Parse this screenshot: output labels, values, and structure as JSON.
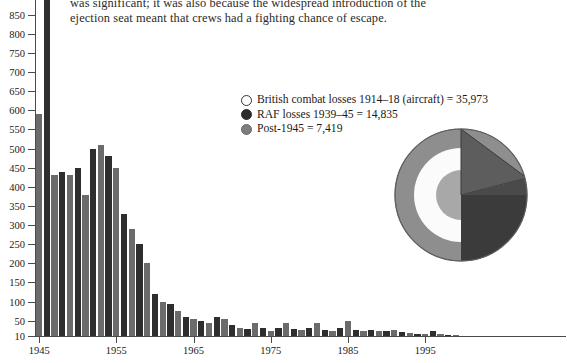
{
  "body_text": {
    "lines": [
      "was significant; it was also because the widespread introduction of the",
      "ejection seat meant that crews had a fighting chance of escape."
    ]
  },
  "legend": {
    "items": [
      {
        "marker": "open-circle",
        "label": "British combat losses 1914–18 (aircraft) = 35,973",
        "value": 35973,
        "color": "#ffffff"
      },
      {
        "marker": "filled-circle",
        "label": "RAF losses 1939–45 = 14,835",
        "value": 14835,
        "color": "#2d2d2d"
      },
      {
        "marker": "gray-circle",
        "label": "Post-1945 = 7,419",
        "value": 7419,
        "color": "#7d7d7d"
      }
    ]
  },
  "chart_data": {
    "type": "bar",
    "title": "",
    "xlabel": "",
    "ylabel": "",
    "ylim": [
      10,
      920
    ],
    "xlim": [
      1945,
      2000
    ],
    "grid": false,
    "legend_position": "upper-right",
    "ytick_labels": [
      "10",
      "50",
      "100",
      "150",
      "200",
      "250",
      "300",
      "350",
      "400",
      "450",
      "500",
      "550",
      "600",
      "650",
      "700",
      "750",
      "800",
      "850",
      "900"
    ],
    "ytick_values": [
      10,
      50,
      100,
      150,
      200,
      250,
      300,
      350,
      400,
      450,
      500,
      550,
      600,
      650,
      700,
      750,
      800,
      850,
      900
    ],
    "xtick_labels": [
      "1945",
      "1955",
      "1965",
      "1975",
      "1985",
      "1995"
    ],
    "xtick_values": [
      1945,
      1955,
      1965,
      1975,
      1985,
      1995
    ],
    "bar_colors": {
      "dark": "#2e2e2e",
      "medium": "#6b6b6b"
    },
    "categories": [
      1945,
      1946,
      1947,
      1948,
      1949,
      1950,
      1951,
      1952,
      1953,
      1954,
      1955,
      1956,
      1957,
      1958,
      1959,
      1960,
      1961,
      1962,
      1963,
      1964,
      1965,
      1966,
      1967,
      1968,
      1969,
      1970,
      1971,
      1972,
      1973,
      1974,
      1975,
      1976,
      1977,
      1978,
      1979,
      1980,
      1981,
      1982,
      1983,
      1984,
      1985,
      1986,
      1987,
      1988,
      1989,
      1990,
      1991,
      1992,
      1993,
      1994,
      1995,
      1996,
      1997,
      1998,
      1999
    ],
    "values": [
      590,
      930,
      430,
      440,
      430,
      450,
      380,
      500,
      510,
      480,
      450,
      330,
      290,
      250,
      200,
      120,
      100,
      95,
      75,
      60,
      55,
      50,
      45,
      60,
      55,
      40,
      30,
      28,
      45,
      30,
      22,
      30,
      45,
      28,
      25,
      30,
      45,
      26,
      24,
      30,
      50,
      26,
      24,
      26,
      22,
      24,
      25,
      20,
      18,
      14,
      16,
      22,
      14,
      12,
      10
    ],
    "series": [
      {
        "name": "Post-1945 RAF aircraft losses by year",
        "values": [
          590,
          930,
          430,
          440,
          430,
          450,
          380,
          500,
          510,
          480,
          450,
          330,
          290,
          250,
          200,
          120,
          100,
          95,
          75,
          60,
          55,
          50,
          45,
          60,
          55,
          40,
          30,
          28,
          45,
          30,
          22,
          30,
          45,
          28,
          25,
          30,
          45,
          26,
          24,
          30,
          50,
          26,
          24,
          26,
          22,
          24,
          25,
          20,
          18,
          14,
          16,
          22,
          14,
          12,
          10
        ]
      }
    ]
  },
  "circle_diagram": {
    "type": "proportional-circles-with-quadrant",
    "rings": [
      {
        "name": "post-1945",
        "value": 7419,
        "color": "#8e8e8e"
      },
      {
        "name": "british-1914-18",
        "value": 35973,
        "color": "#fbfbfb"
      },
      {
        "name": "raf-1939-45",
        "value": 14835,
        "color": "#a5a5a5"
      }
    ],
    "overlay": [
      {
        "name": "upper-quadrant-wedge",
        "color": "#575757"
      },
      {
        "name": "lower-right-quadrant",
        "color": "#3a3a3a"
      }
    ]
  }
}
